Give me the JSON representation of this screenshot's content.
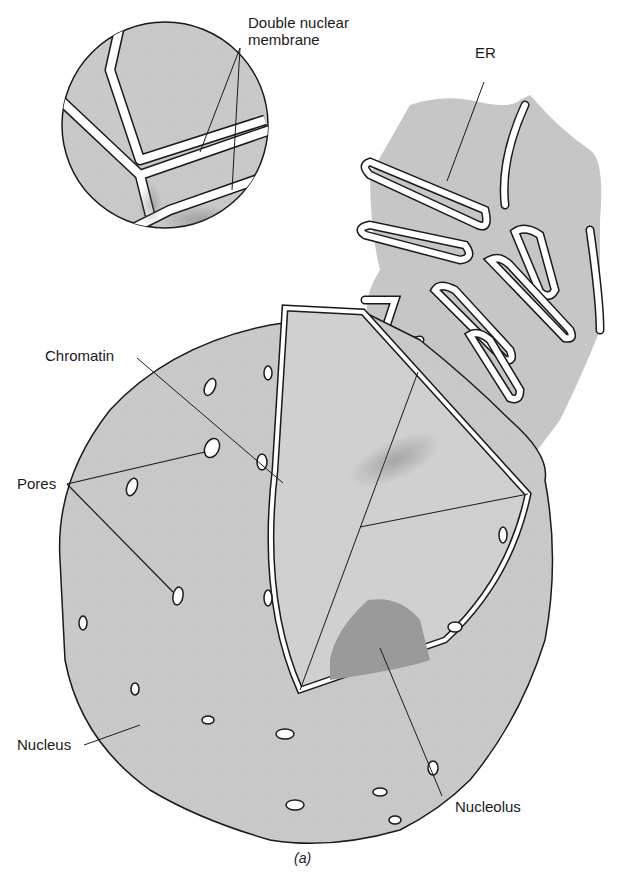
{
  "figure": {
    "caption": "(a)",
    "colors": {
      "cytoplasm_fill": "#c9c9c9",
      "nucleus_fill": "#cdcdcd",
      "nucleolus_fill": "#9a9a9a",
      "membrane_fill": "#ffffff",
      "outline": "#1a1a1a",
      "background": "#ffffff"
    }
  },
  "labels": {
    "double_membrane_line1": "Double nuclear",
    "double_membrane_line2": "membrane",
    "er": "ER",
    "chromatin": "Chromatin",
    "pores": "Pores",
    "nucleus": "Nucleus",
    "nucleolus": "Nucleolus"
  }
}
